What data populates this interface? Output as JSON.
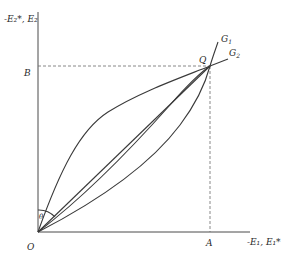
{
  "diagram": {
    "y_axis_label": "-E₂*, E₂",
    "x_axis_label": "-E₁, E₁*",
    "points": {
      "origin": "O",
      "intersection": "Q",
      "x_projection": "A",
      "y_projection": "B"
    },
    "curves": {
      "g1": "G",
      "g1_sub": "1",
      "g2": "G",
      "g2_sub": "2"
    },
    "angle_label": "θ",
    "colors": {
      "line": "#3a3a3a",
      "background": "#ffffff"
    }
  }
}
